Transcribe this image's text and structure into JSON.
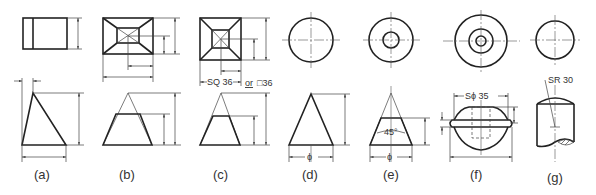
{
  "figure": {
    "type": "technical-drawing",
    "views": [
      {
        "id": "a",
        "label": "(a)",
        "shape": "wedge / triangular prism"
      },
      {
        "id": "b",
        "label": "(b)",
        "shape": "frustum of rectangular pyramid"
      },
      {
        "id": "c",
        "label": "(c)",
        "shape": "frustum of square pyramid",
        "annotation": "SQ 36",
        "alt_connector": "or",
        "alt_annotation": "□36"
      },
      {
        "id": "d",
        "label": "(d)",
        "shape": "cone",
        "annotation": "ϕ"
      },
      {
        "id": "e",
        "label": "(e)",
        "shape": "frustum of cone",
        "annotation": "ϕ",
        "angle": "45°"
      },
      {
        "id": "f",
        "label": "(f)",
        "shape": "sphere with flange",
        "annotation": "Sϕ 35"
      },
      {
        "id": "g",
        "label": "(g)",
        "shape": "cylinder with spherical end",
        "annotation": "SR 30"
      }
    ]
  }
}
